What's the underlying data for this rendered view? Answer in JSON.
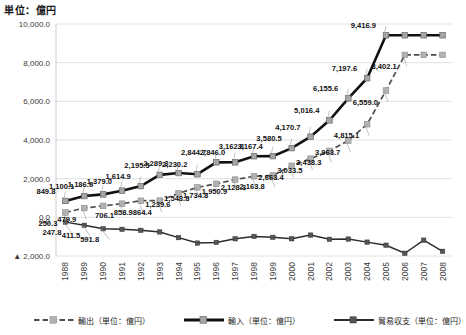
{
  "unit_title": "単位：億円",
  "legend": {
    "position": "bottom",
    "items": [
      {
        "label": "輸出（単位：億円）",
        "style": "dashed",
        "name": "legend-export"
      },
      {
        "label": "輸入（単位：億円）",
        "style": "thick-solid",
        "name": "legend-import"
      },
      {
        "label": "貿易収支（単位：億円）",
        "style": "solid",
        "name": "legend-balance"
      }
    ]
  },
  "chart_data": {
    "type": "line",
    "title": "単位：億円",
    "xlabel": "",
    "ylabel": "単位：億円",
    "ylim": [
      -2000,
      10000
    ],
    "yticks": [
      10000,
      8000,
      6000,
      4000,
      2000,
      0,
      -2000
    ],
    "ytick_labels": [
      "10,000.0",
      "8,000.0",
      "6,000.0",
      "4,000.0",
      "2,000.0",
      "0.0",
      "▲ 2,000.0"
    ],
    "grid": true,
    "categories": [
      "1988",
      "1989",
      "1990",
      "1991",
      "1992",
      "1993",
      "1994",
      "1995",
      "1996",
      "1997",
      "1998",
      "1999",
      "2000",
      "2001",
      "2002",
      "2003",
      "2004",
      "2005",
      "2006",
      "2007",
      "2008"
    ],
    "series": [
      {
        "name": "輸出（単位：億円）",
        "style": "dashed",
        "values": [
          250.3,
          479.9,
          591.4,
          706.1,
          858.9,
          864.4,
          1239.6,
          1548.8,
          1734.8,
          1950.9,
          2128.3,
          2163.8,
          2663.4,
          3033.5,
          3438.3,
          3963.7,
          4815.1,
          6559.0,
          8402.1,
          8402.1,
          8402.1
        ],
        "labels": [
          "250.3",
          "479.9",
          "",
          "706.1",
          "858.9",
          "864.4",
          "1,239.6",
          "1,548.8",
          "1,734.8",
          "1,950.9",
          "2,128.3",
          "2,163.8",
          "2,663.4",
          "3,033.5",
          "3,438.3",
          "3,963.7",
          "4,815.1",
          "6,559.0",
          "8,402.1",
          "",
          ""
        ]
      },
      {
        "name": "輸入（単位：億円）",
        "style": "thick-solid",
        "values": [
          849.8,
          1100.1,
          1186.6,
          1379.0,
          1614.9,
          2195.5,
          2289.3,
          2230.2,
          2844.7,
          2846.0,
          3162.8,
          3167.4,
          3580.5,
          4170.7,
          5016.4,
          6155.6,
          7197.6,
          9416.9,
          9416.9,
          9416.9,
          9416.9
        ],
        "labels": [
          "849.8",
          "1,100.1",
          "1,186.6",
          "1,379.0",
          "1,614.9",
          "2,195.5",
          "2,289.3",
          "2,230.2",
          "2,844.7",
          "2,846.0",
          "3,162.8",
          "3,167.4",
          "3,580.5",
          "4,170.7",
          "5,016.4",
          "6,155.6",
          "7,197.6",
          "9,416.9",
          "",
          "",
          ""
        ]
      },
      {
        "name": "貿易収支（単位：億円）",
        "style": "solid",
        "values": [
          -247.8,
          -411.5,
          -591.8,
          -620.4,
          -672.8,
          -756.0,
          -1049.7,
          -1331.2,
          -1296.0,
          -1110.0,
          -985.7,
          -1034.2,
          -1110.0,
          -917.3,
          -1136.9,
          -1122.0,
          -1281.9,
          -1441.1,
          -1857.9,
          -1180.2,
          -1757.6
        ],
        "labels": [
          "247.8",
          "411.5",
          "591.8",
          "",
          "",
          "",
          "",
          "",
          "",
          "",
          "",
          "",
          "",
          "",
          "",
          "",
          "",
          "",
          "",
          "",
          ""
        ]
      }
    ],
    "annotations": [
      {
        "text": "0.0",
        "near": "y-axis-zero"
      },
      {
        "text": "2,230.2",
        "series": "輸入",
        "year": "1995"
      },
      {
        "text": "2,844.7",
        "series": "輸入",
        "year": "1996"
      },
      {
        "text": "9,416.9",
        "series": "輸入",
        "year": "2008"
      },
      {
        "text": "8,402.1",
        "series": "輸出",
        "year": "2008"
      }
    ]
  }
}
